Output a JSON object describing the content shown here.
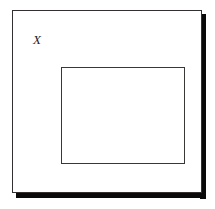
{
  "figure": {
    "kind": "set-diagram",
    "background_color": "#ffffff",
    "outer_set": {
      "label": "X",
      "label_style": "italic-serif",
      "stroke_color": "#33302f",
      "fill_color": "#ffffff",
      "shadow_color": "#0a0a0a"
    },
    "inner_set": {
      "label": "",
      "stroke_color": "#3a3735",
      "fill_color": "#ffffff"
    }
  }
}
